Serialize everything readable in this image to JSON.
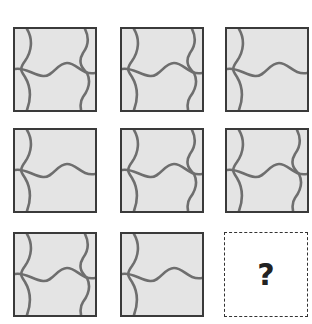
{
  "puzzle": {
    "rows": 3,
    "cols": 3,
    "tiles": [
      {
        "row": 1,
        "col": 1,
        "left_curve": true,
        "right_curve": true,
        "horizontal_curve": true
      },
      {
        "row": 1,
        "col": 2,
        "left_curve": true,
        "right_curve": true,
        "horizontal_curve": true
      },
      {
        "row": 1,
        "col": 3,
        "left_curve": true,
        "right_curve": false,
        "horizontal_curve": true
      },
      {
        "row": 2,
        "col": 1,
        "left_curve": true,
        "right_curve": false,
        "horizontal_curve": true
      },
      {
        "row": 2,
        "col": 2,
        "left_curve": true,
        "right_curve": true,
        "horizontal_curve": true
      },
      {
        "row": 2,
        "col": 3,
        "left_curve": true,
        "right_curve": true,
        "horizontal_curve": true
      },
      {
        "row": 3,
        "col": 1,
        "left_curve": true,
        "right_curve": true,
        "horizontal_curve": true
      },
      {
        "row": 3,
        "col": 2,
        "left_curve": true,
        "right_curve": false,
        "horizontal_curve": true
      }
    ],
    "answer_cell": {
      "row": 3,
      "col": 3,
      "label": "?"
    }
  },
  "colors": {
    "tile_fill": "#e4e4e4",
    "tile_border": "#3a3a3a",
    "curve_stroke": "#6e6e6e",
    "answer_border": "#333333"
  }
}
